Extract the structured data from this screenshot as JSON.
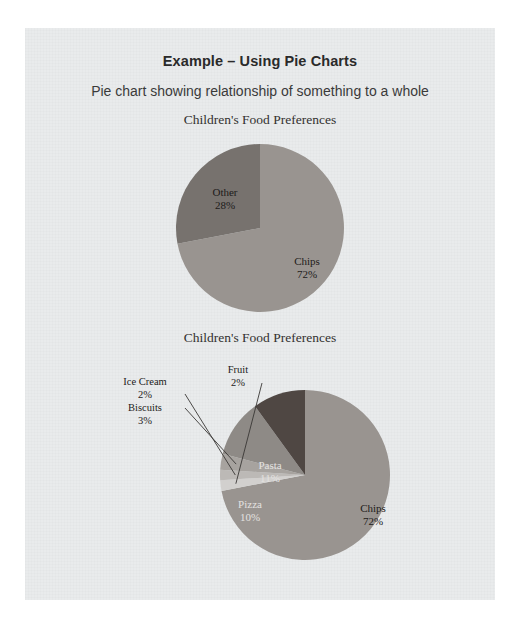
{
  "document": {
    "title": "Example – Using Pie Charts",
    "subtitle": "Pie chart showing relationship of something to a whole"
  },
  "colors": {
    "page_background": "#e9ebec",
    "outer_background": "#ffffff",
    "text": "#2a2a2a",
    "leader_line": "#3a3836",
    "slice_chips": "#999490",
    "slice_other": "#77726e",
    "slice_pasta": "#8e8a86",
    "slice_pizza": "#4f4743",
    "slice_biscuits": "#a7a39f",
    "slice_icecream": "#bcb9b6",
    "slice_fruit": "#d2d0ce"
  },
  "chart_data": [
    {
      "type": "pie",
      "id": "chart-one",
      "title": "Children's Food Preferences",
      "legend": "none",
      "start_angle_deg": 0,
      "direction": "clockwise",
      "categories": [
        "Chips",
        "Other"
      ],
      "values": [
        72,
        28
      ],
      "labels": [
        "Chips\n72%",
        "Other\n28%"
      ],
      "slices": [
        {
          "name": "Chips",
          "value": 72,
          "label": "Chips",
          "percent": "72%",
          "color": "#999490",
          "label_placement": "inside"
        },
        {
          "name": "Other",
          "value": 28,
          "label": "Other",
          "percent": "28%",
          "color": "#77726e",
          "label_placement": "inside"
        }
      ]
    },
    {
      "type": "pie",
      "id": "chart-two",
      "title": "Children's Food Preferences",
      "legend": "none",
      "start_angle_deg": 0,
      "direction": "clockwise",
      "categories": [
        "Chips",
        "Fruit",
        "Ice Cream",
        "Biscuits",
        "Pasta",
        "Pizza"
      ],
      "values": [
        72,
        2,
        2,
        3,
        11,
        10
      ],
      "slices": [
        {
          "name": "Chips",
          "value": 72,
          "label": "Chips",
          "percent": "72%",
          "color": "#999490",
          "label_placement": "inside"
        },
        {
          "name": "Fruit",
          "value": 2,
          "label": "Fruit",
          "percent": "2%",
          "color": "#d2d0ce",
          "label_placement": "callout"
        },
        {
          "name": "Ice Cream",
          "value": 2,
          "label": "Ice Cream",
          "percent": "2%",
          "color": "#bcb9b6",
          "label_placement": "callout"
        },
        {
          "name": "Biscuits",
          "value": 3,
          "label": "Biscuits",
          "percent": "3%",
          "color": "#a7a39f",
          "label_placement": "callout"
        },
        {
          "name": "Pasta",
          "value": 11,
          "label": "Pasta",
          "percent": "11%",
          "color": "#8e8a86",
          "label_placement": "inside"
        },
        {
          "name": "Pizza",
          "value": 10,
          "label": "Pizza",
          "percent": "10%",
          "color": "#4f4743",
          "label_placement": "inside"
        }
      ]
    }
  ]
}
